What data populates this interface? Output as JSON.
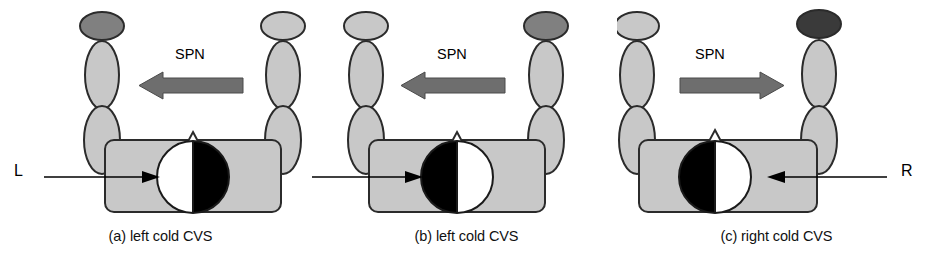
{
  "figure": {
    "type": "diagram",
    "panel_count": 3
  },
  "colors": {
    "body_fill": "#c8c8c8",
    "body_stroke": "#2b2b2b",
    "head_light": "#c8c8c8",
    "head_dark": "#808080",
    "head_darker": "#3a3a3a",
    "arrow_gray": "#6e6e6e",
    "arrow_black": "#000000",
    "half_black": "#000000",
    "half_white": "#ffffff",
    "background": "#ffffff"
  },
  "panels": [
    {
      "id": "a",
      "caption": "(a) left cold CVS",
      "spn_label": "SPN",
      "spn_direction": "left",
      "side_label": "L",
      "side_label_visible": true,
      "side_arrow_direction": "right",
      "dark_head_side": "left",
      "head_left_half": "white",
      "head_right_half": "black"
    },
    {
      "id": "b",
      "caption": "(b) left cold CVS",
      "spn_label": "SPN",
      "spn_direction": "left",
      "side_label": "",
      "side_label_visible": false,
      "side_arrow_direction": "right",
      "dark_head_side": "right",
      "head_left_half": "black",
      "head_right_half": "white"
    },
    {
      "id": "c",
      "caption": "(c) right cold CVS",
      "spn_label": "SPN",
      "spn_direction": "right",
      "side_label": "R",
      "side_label_visible": true,
      "side_arrow_direction": "left",
      "dark_head_side": "right",
      "head_left_half": "black",
      "head_right_half": "white"
    }
  ]
}
